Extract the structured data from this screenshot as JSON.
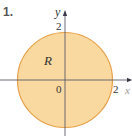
{
  "problem_number": "1.",
  "figure": {
    "region_label": "R",
    "axis_x_label": "x",
    "axis_y_label": "y",
    "origin_label": "0",
    "y_tick_label": "2",
    "x_tick_label": "2",
    "shape": "circle",
    "radius": 2,
    "fill_color": "#fad9a0",
    "stroke_color": "#e8a14a",
    "axis_color": "#5a5a6a"
  }
}
